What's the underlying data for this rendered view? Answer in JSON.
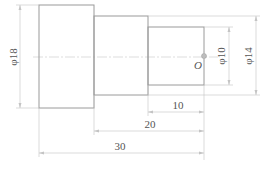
{
  "diagram": {
    "type": "stepped-shaft-drawing",
    "colors": {
      "outline": "#9a9a9a",
      "dimension": "#c4c4c4",
      "text": "#555555"
    },
    "diameters": [
      {
        "label": "φ18",
        "value": 18
      },
      {
        "label": "φ10",
        "value": 10
      },
      {
        "label": "φ14",
        "value": 14
      }
    ],
    "lengths": [
      {
        "label": "10",
        "value": 10
      },
      {
        "label": "20",
        "value": 20
      },
      {
        "label": "30",
        "value": 30
      }
    ],
    "point_label": "O"
  }
}
